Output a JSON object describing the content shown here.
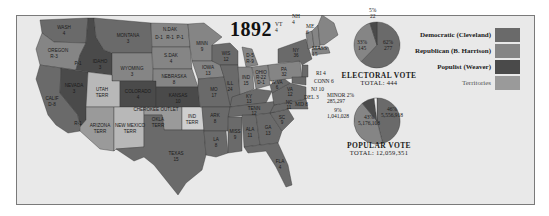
{
  "title": "1892",
  "colors": {
    "democratic": "#6a6a6a",
    "republican": "#858585",
    "populist": "#4a4a4a",
    "territories": "#9a9a9a",
    "split": "#b8b8b8",
    "background": "#e9e9e9",
    "water": "#f4f4f4"
  },
  "legend": [
    {
      "label": "Democratic (Cleveland)",
      "color_key": "democratic"
    },
    {
      "label": "Republican (B. Harrison)",
      "color_key": "republican"
    },
    {
      "label": "Populist (Weaver)",
      "color_key": "populist"
    },
    {
      "label": "Territories",
      "color_key": "territories"
    }
  ],
  "electoral_vote": {
    "heading": "ELECTORAL VOTE",
    "total_label": "TOTAL: 444",
    "slices": [
      {
        "party": "Democratic",
        "pct": "62%",
        "value": "277"
      },
      {
        "party": "Republican",
        "pct": "33%",
        "value": "145"
      },
      {
        "party": "Populist",
        "pct": "5%",
        "value": "22"
      }
    ]
  },
  "popular_vote": {
    "heading": "POPULAR VOTE",
    "total_label": "TOTAL: 12,059,351",
    "slices": [
      {
        "party": "Democratic",
        "pct": "46%",
        "value": "5,556,918"
      },
      {
        "party": "Republican",
        "pct": "43%",
        "value": "5,176,108"
      },
      {
        "party": "Populist",
        "pct": "9%",
        "value": "1,041,028"
      },
      {
        "party": "Minor",
        "pct": "MINOR 2%",
        "value": "285,297"
      }
    ]
  },
  "states": [
    {
      "name": "WASH",
      "ev": "4"
    },
    {
      "name": "OREGON",
      "ev": "R-3"
    },
    {
      "name": "",
      "ev": "P-1"
    },
    {
      "name": "CALIF",
      "ev": "D-8"
    },
    {
      "name": "",
      "ev": "R-1"
    },
    {
      "name": "NEVADA",
      "ev": "3"
    },
    {
      "name": "IDAHO",
      "ev": "3"
    },
    {
      "name": "MONTANA",
      "ev": "3"
    },
    {
      "name": "WYOMING",
      "ev": "3"
    },
    {
      "name": "UTAH",
      "ev": "TERR"
    },
    {
      "name": "COLORADO",
      "ev": "4"
    },
    {
      "name": "ARIZONA",
      "ev": "TERR"
    },
    {
      "name": "NEW MEXICO",
      "ev": "TERR"
    },
    {
      "name": "N.DAK",
      "ev": "D-1"
    },
    {
      "name": "",
      "ev": "R-1"
    },
    {
      "name": "",
      "ev": "P-1"
    },
    {
      "name": "S.DAK",
      "ev": "4"
    },
    {
      "name": "NEBRASKA",
      "ev": "8"
    },
    {
      "name": "KANSAS",
      "ev": "10"
    },
    {
      "name": "CHEROKEE OUTLET",
      "ev": ""
    },
    {
      "name": "OKLA",
      "ev": "TERR"
    },
    {
      "name": "IND",
      "ev": "TERR"
    },
    {
      "name": "TEXAS",
      "ev": "15"
    },
    {
      "name": "MINN",
      "ev": "9"
    },
    {
      "name": "IOWA",
      "ev": "13"
    },
    {
      "name": "MO",
      "ev": "17"
    },
    {
      "name": "ARK",
      "ev": "8"
    },
    {
      "name": "LA",
      "ev": "8"
    },
    {
      "name": "WIS",
      "ev": "12"
    },
    {
      "name": "ILL",
      "ev": "24"
    },
    {
      "name": "MICH",
      "ev": "D-5"
    },
    {
      "name": "",
      "ev": "R-9"
    },
    {
      "name": "IND",
      "ev": "15"
    },
    {
      "name": "OHIO",
      "ev": "R-22"
    },
    {
      "name": "",
      "ev": "D-1"
    },
    {
      "name": "KY",
      "ev": "13"
    },
    {
      "name": "TENN",
      "ev": "12"
    },
    {
      "name": "MISS",
      "ev": "9"
    },
    {
      "name": "ALA",
      "ev": "11"
    },
    {
      "name": "GA",
      "ev": "13"
    },
    {
      "name": "FLA",
      "ev": "4"
    },
    {
      "name": "SC",
      "ev": "9"
    },
    {
      "name": "NC",
      "ev": "11"
    },
    {
      "name": "VA",
      "ev": "12"
    },
    {
      "name": "W.VA",
      "ev": "6"
    },
    {
      "name": "PA",
      "ev": "32"
    },
    {
      "name": "NY",
      "ev": "36"
    },
    {
      "name": "VT",
      "ev": "4"
    },
    {
      "name": "NH",
      "ev": "4"
    },
    {
      "name": "ME",
      "ev": "6"
    },
    {
      "name": "MASS",
      "ev": "15"
    },
    {
      "name": "RI",
      "ev": "4"
    },
    {
      "name": "CONN",
      "ev": "6"
    },
    {
      "name": "NJ",
      "ev": "10"
    },
    {
      "name": "DEL",
      "ev": "3"
    },
    {
      "name": "MD",
      "ev": "8"
    }
  ]
}
